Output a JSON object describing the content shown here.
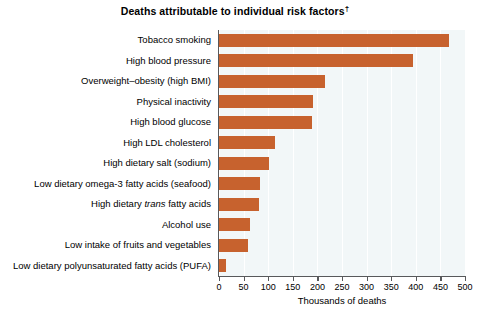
{
  "chart_data": {
    "type": "bar",
    "orientation": "horizontal",
    "title": "Deaths attributable to individual risk factors",
    "title_superscript": "†",
    "xlabel": "Thousands of deaths",
    "ylabel": "",
    "xlim": [
      0,
      500
    ],
    "xticks": [
      0,
      50,
      100,
      150,
      200,
      250,
      300,
      350,
      400,
      450,
      500
    ],
    "xticklabels": [
      "0",
      "50",
      "100",
      "150",
      "200",
      "250",
      "300",
      "350",
      "400",
      "450",
      "500"
    ],
    "grid": "vertical",
    "legend": "none",
    "bar_color": "#c7622e",
    "plot_background": "#f2f7f8",
    "categories": [
      "Tobacco smoking",
      "High blood pressure",
      "Overweight–obesity (high BMI)",
      "Physical inactivity",
      "High blood glucose",
      "High LDL cholesterol",
      "High dietary salt (sodium)",
      "Low dietary omega-3 fatty acids (seafood)",
      "High dietary trans fatty acids",
      "Alcohol use",
      "Low intake of fruits and vegetables",
      "Low dietary polyunsaturated fatty acids (PUFA)"
    ],
    "values": [
      467,
      395,
      216,
      191,
      190,
      113,
      102,
      84,
      82,
      64,
      58,
      15
    ]
  },
  "categories_html": [
    "Tobacco smoking",
    "High blood pressure",
    "Overweight&#8211;obesity (high BMI)",
    "Physical inactivity",
    "High blood glucose",
    "High LDL cholesterol",
    "High dietary salt (sodium)",
    "Low dietary omega-3 fatty acids (seafood)",
    "High dietary <i>trans</i> fatty acids",
    "Alcohol use",
    "Low intake of fruits and vegetables",
    "Low dietary polyunsaturated fatty acids (PUFA)"
  ]
}
